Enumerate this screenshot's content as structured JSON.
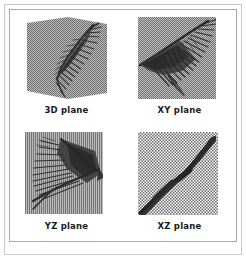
{
  "figure": {
    "type": "multi-panel-projection-figure",
    "panel_count": 4,
    "background_color": "#ffffff",
    "frame_color_outer": "#c9c9c9",
    "frame_color_inner": "#a8a8a8",
    "label_color": "#1a1a1a",
    "texture_base_color": "#b5b5b5",
    "structure_color": "#3a3a3a",
    "panels": [
      {
        "id": "panel-3d",
        "label": "3D plane",
        "position": "top-left",
        "texture": "fine-dither",
        "description": "bent quadrilateral plane with feather-like branching structure"
      },
      {
        "id": "panel-xy",
        "label": "XY plane",
        "position": "top-right",
        "texture": "fine-dither",
        "description": "frontal projection of feather-like branching structure"
      },
      {
        "id": "panel-yz",
        "label": "YZ plane",
        "position": "bottom-left",
        "texture": "vertical-dither",
        "description": "side projection of feather-like branching structure"
      },
      {
        "id": "panel-xz",
        "label": "XZ plane",
        "position": "bottom-right",
        "texture": "checker-dither",
        "description": "edge-on projection collapsing to a thick diagonal band"
      }
    ]
  }
}
